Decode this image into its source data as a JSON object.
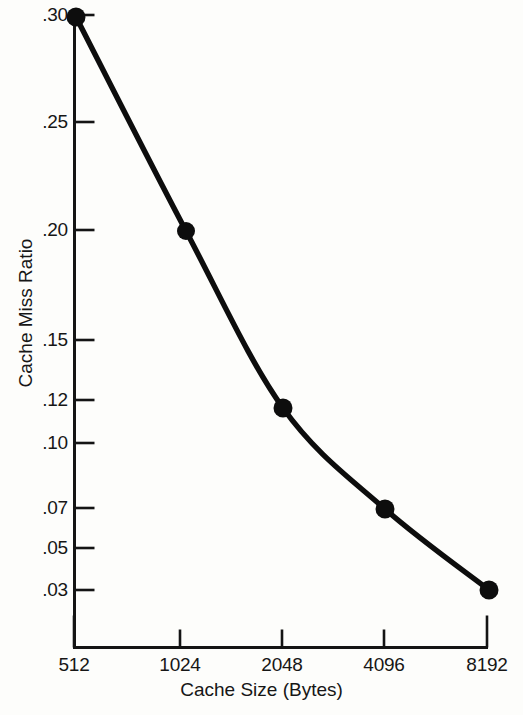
{
  "figure": {
    "background_color": "#fdfdfb",
    "ink_color": "#111111"
  },
  "chart_data": {
    "type": "line",
    "title": "",
    "subtitle": "",
    "xlabel": "Cache Size (Bytes)",
    "ylabel": "Cache Miss Ratio",
    "x_tick_labels": [
      "512",
      "1024",
      "2048",
      "4096",
      "8192"
    ],
    "x_values": [
      512,
      1024,
      2048,
      4096,
      8192
    ],
    "x_scale": "log2-category",
    "y_tick_labels": [
      ".30",
      ".25",
      ".20",
      ".15",
      ".12",
      ".10",
      ".07",
      ".05",
      ".03"
    ],
    "y_tick_values": [
      0.3,
      0.25,
      0.2,
      0.15,
      0.12,
      0.1,
      0.07,
      0.05,
      0.03
    ],
    "y_scale": "nonlinear-custom",
    "ylim": [
      0.0,
      0.3
    ],
    "grid": false,
    "legend": null,
    "legend_position": "none",
    "marker": "filled-circle",
    "series": [
      {
        "name": "Cache Miss Ratio",
        "categories": [
          "512",
          "1024",
          "2048",
          "4096",
          "8192"
        ],
        "values": [
          0.3,
          0.2,
          0.115,
          0.068,
          0.03
        ],
        "value_labels": [
          ".30",
          ".20",
          ".12",
          ".07",
          ".03"
        ]
      }
    ],
    "annotations": []
  },
  "axes": {
    "y_ticks": [
      {
        "label": ".30",
        "y": 15
      },
      {
        "label": ".25",
        "y": 122
      },
      {
        "label": ".20",
        "y": 230
      },
      {
        "label": ".15",
        "y": 340
      },
      {
        "label": ".12",
        "y": 400
      },
      {
        "label": ".10",
        "y": 443
      },
      {
        "label": ".07",
        "y": 508
      },
      {
        "label": ".05",
        "y": 548
      },
      {
        "label": ".03",
        "y": 590
      }
    ],
    "x_ticks": [
      {
        "label": "512",
        "x": 74
      },
      {
        "label": "1024",
        "x": 180
      },
      {
        "label": "2048",
        "x": 282
      },
      {
        "label": "4096",
        "x": 384
      },
      {
        "label": "8192",
        "x": 487
      }
    ]
  },
  "points": [
    {
      "label": "512",
      "x": 76,
      "y": 17
    },
    {
      "label": "1024",
      "x": 186,
      "y": 231
    },
    {
      "label": "2048",
      "x": 283,
      "y": 408
    },
    {
      "label": "4096",
      "x": 385,
      "y": 509
    },
    {
      "label": "8192",
      "x": 489,
      "y": 590
    }
  ]
}
